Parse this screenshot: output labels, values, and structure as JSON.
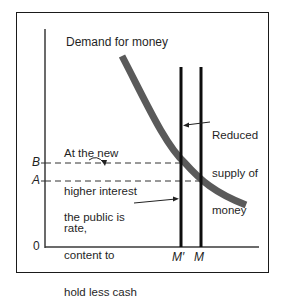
{
  "diagram": {
    "title_label": "Demand for money",
    "supply_label": {
      "line1": "Reduced",
      "line2": "supply of",
      "line3": "money"
    },
    "annotation_top": {
      "line1": "At the new",
      "line2": "higher interest",
      "line3": "rate,"
    },
    "annotation_bottom": {
      "line1": "the public is",
      "line2": "content to",
      "line3": "hold less cash"
    },
    "y_axis": {
      "origin_label": "0",
      "tick_B": "B",
      "tick_A": "A"
    },
    "x_axis": {
      "tick_M_prime": "M′",
      "tick_M": "M"
    },
    "colors": {
      "demand_curve": "#5a5a5a",
      "supply_lines": "#0d0d0d",
      "axes": "#3a3a3a",
      "frame": "#1a1a1a",
      "text": "#1f1f1f"
    }
  }
}
